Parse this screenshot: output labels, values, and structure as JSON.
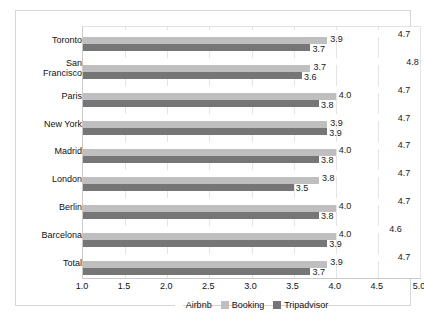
{
  "chart_data": {
    "type": "bar",
    "orientation": "horizontal",
    "title": "",
    "xlabel": "",
    "ylabel": "",
    "xlim": [
      1.0,
      5.0
    ],
    "xticks": [
      "1.0",
      "1.5",
      "2.0",
      "2.5",
      "3.0",
      "3.5",
      "4.0",
      "4.5",
      "5.0"
    ],
    "grid": true,
    "legend_position": "bottom",
    "categories": [
      "Toronto",
      "San Francisco",
      "Paris",
      "New York",
      "Madrid",
      "London",
      "Berlin",
      "Barcelona",
      "Total"
    ],
    "series": [
      {
        "name": "Airbnb",
        "color": "#ffffff",
        "values": [
          4.7,
          4.8,
          4.7,
          4.7,
          4.7,
          4.7,
          4.7,
          4.6,
          4.7
        ],
        "labels": [
          "4.7",
          "4.8",
          "4.7",
          "4.7",
          "4.7",
          "4.7",
          "4.7",
          "4.6",
          "4.7"
        ]
      },
      {
        "name": "Booking",
        "color": "#bfbfbf",
        "values": [
          3.9,
          3.7,
          4.0,
          3.9,
          4.0,
          3.8,
          4.0,
          4.0,
          3.9
        ],
        "labels": [
          "3.9",
          "3.7",
          "4.0",
          "3.9",
          "4.0",
          "3.8",
          "4.0",
          "4.0",
          "3.9"
        ]
      },
      {
        "name": "Tripadvisor",
        "color": "#767676",
        "values": [
          3.7,
          3.6,
          3.8,
          3.9,
          3.8,
          3.5,
          3.8,
          3.9,
          3.7
        ],
        "labels": [
          "3.7",
          "3.6",
          "3.8",
          "3.9",
          "3.8",
          "3.5",
          "3.8",
          "3.9",
          "3.7"
        ]
      }
    ]
  },
  "legend": {
    "items": [
      {
        "label": "Airbnb",
        "swatch": "airbnb"
      },
      {
        "label": "Booking",
        "swatch": "booking"
      },
      {
        "label": "Tripadvisor",
        "swatch": "tripadvisor"
      }
    ]
  }
}
